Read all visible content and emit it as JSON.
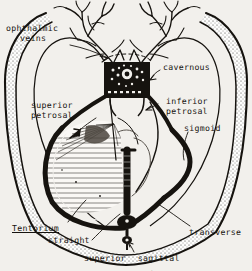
{
  "figure": {
    "style": "scanned line drawing with stipple and hatching",
    "background_color": "#f2f0ec",
    "ink_color": "#16130f"
  },
  "labels": {
    "ophthalmic_veins_line1": "ophthalmic",
    "ophthalmic_veins_line2": "veins",
    "cavernous": "cavernous",
    "inferior_petrosal_line1": "inferior",
    "inferior_petrosal_line2": "petrosal",
    "sigmoid": "sigmoid",
    "superior_petrosal_line1": "superior",
    "superior_petrosal_line2": "petrosal",
    "tentorium": "Tentorium",
    "straight": "straight",
    "transverse": "transverse",
    "superior_sagittal_word1": "superior",
    "superior_sagittal_word2": "sagittal"
  },
  "structures": [
    {
      "name": "skull-outline",
      "description": "double contour band with stippled diploe"
    },
    {
      "name": "ophthalmic-veins",
      "description": "two branching vein trees at top"
    },
    {
      "name": "cavernous-sinus",
      "description": "dark rectangular block with central ring"
    },
    {
      "name": "superior-petrosal-sinus",
      "description": "left oblique sinus channel"
    },
    {
      "name": "inferior-petrosal-sinus",
      "description": "right oblique sinus channel"
    },
    {
      "name": "sigmoid-sinus",
      "description": "thick S-shaped curve"
    },
    {
      "name": "transverse-sinus",
      "description": "broad lateral curve to confluence"
    },
    {
      "name": "straight-sinus",
      "description": "vertical dark bar to confluence"
    },
    {
      "name": "superior-sagittal-sinus",
      "description": "midline sinus at confluence"
    },
    {
      "name": "confluence-of-sinuses",
      "description": "dark junction at bottom centre"
    },
    {
      "name": "tentorium-cerebelli",
      "description": "fan of fine hatch lines"
    }
  ],
  "bleed_text": "."
}
